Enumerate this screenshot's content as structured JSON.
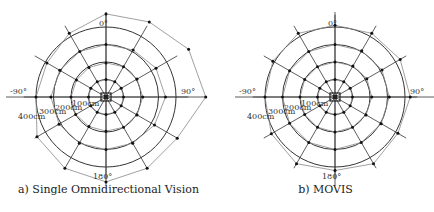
{
  "chart_data": [
    {
      "type": "polar-scatter",
      "title": "a) Single Omnidirectional Vision",
      "center_px": [
        106,
        97
      ],
      "px_per_100cm": 17.5,
      "angles_deg": [
        0,
        30,
        60,
        90,
        120,
        150,
        180,
        -150,
        -120,
        -90,
        -60,
        -30
      ],
      "angle_labels": [
        "0°",
        "90°",
        "180°",
        "-90°"
      ],
      "rings_cm": [
        100,
        200,
        300,
        400
      ],
      "ring_labels": [
        "100cm",
        "200cm",
        "300cm",
        "400cm"
      ],
      "ground_truth": "dots at every ring/spoke intersection",
      "series": [
        {
          "name": "estimate 100cm",
          "radii_cm": [
            100,
            100,
            100,
            100,
            100,
            100,
            100,
            100,
            100,
            100,
            100,
            100
          ]
        },
        {
          "name": "estimate 200cm",
          "radii_cm": [
            195,
            200,
            205,
            210,
            205,
            200,
            195,
            195,
            200,
            200,
            195,
            195
          ]
        },
        {
          "name": "estimate 300cm",
          "radii_cm": [
            300,
            310,
            330,
            340,
            320,
            305,
            300,
            305,
            310,
            315,
            305,
            300
          ]
        },
        {
          "name": "estimate 400cm",
          "radii_cm": [
            475,
            495,
            545,
            570,
            470,
            470,
            485,
            470,
            455,
            400,
            390,
            420
          ]
        }
      ]
    },
    {
      "type": "polar-scatter",
      "title": "b) MOVIS",
      "center_px": [
        335,
        97
      ],
      "px_per_100cm": 17.5,
      "angles_deg": [
        0,
        30,
        60,
        90,
        120,
        150,
        180,
        -150,
        -120,
        -90,
        -60,
        -30
      ],
      "angle_labels": [
        "0°",
        "90°",
        "180°",
        "-90°"
      ],
      "rings_cm": [
        100,
        200,
        300,
        400
      ],
      "ring_labels": [
        "100cm",
        "200cm",
        "300cm",
        "400cm"
      ],
      "ground_truth": "dots at every ring/spoke intersection",
      "series": [
        {
          "name": "estimate 100cm",
          "radii_cm": [
            100,
            100,
            100,
            100,
            100,
            100,
            100,
            100,
            100,
            100,
            100,
            100
          ]
        },
        {
          "name": "estimate 200cm",
          "radii_cm": [
            200,
            205,
            210,
            210,
            205,
            200,
            200,
            200,
            200,
            200,
            200,
            200
          ]
        },
        {
          "name": "estimate 300cm",
          "radii_cm": [
            300,
            305,
            310,
            310,
            305,
            300,
            300,
            300,
            300,
            300,
            300,
            300
          ]
        },
        {
          "name": "estimate 400cm",
          "radii_cm": [
            410,
            420,
            430,
            430,
            415,
            440,
            420,
            440,
            420,
            400,
            410,
            420
          ]
        }
      ]
    }
  ],
  "panels": [
    {
      "caption": "a) Single Omnidirectional Vision"
    },
    {
      "caption": "b) MOVIS"
    }
  ]
}
